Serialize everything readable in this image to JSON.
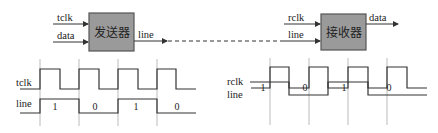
{
  "sender": {
    "block_label": "发送器",
    "inputs": [
      "tclk",
      "data"
    ],
    "output": "line"
  },
  "receiver": {
    "block_label": "接收器",
    "inputs": [
      "rclk",
      "line"
    ],
    "output": "data"
  },
  "left_timing": {
    "clock_label": "tclk",
    "line_label": "line",
    "bits": [
      "1",
      "0",
      "1",
      "0"
    ]
  },
  "right_timing": {
    "clock_label": "rclk",
    "line_label": "line",
    "bits": [
      "1",
      "0",
      "1",
      "0"
    ]
  },
  "colors": {
    "block_fill": "#9a9a9a",
    "block_stroke": "#555555",
    "line": "#333333",
    "guide": "#999999"
  }
}
